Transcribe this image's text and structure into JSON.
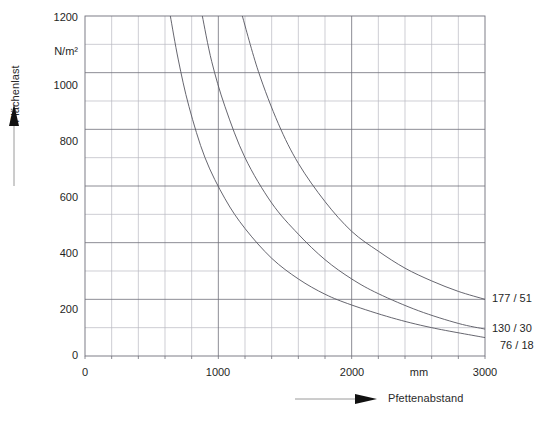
{
  "chart_data": {
    "type": "line",
    "title": "",
    "subtitle": "",
    "xlabel": "Pfettenabstand",
    "ylabel": "Flächenlast",
    "x_unit": "mm",
    "y_unit": "N/m²",
    "xlim": [
      0,
      3000
    ],
    "ylim": [
      0,
      1200
    ],
    "x_ticks": [
      0,
      1000,
      2000,
      3000
    ],
    "x_tick_labels": [
      "0",
      "1000",
      "2000",
      "3000"
    ],
    "y_ticks": [
      0,
      200,
      400,
      600,
      800,
      1000,
      1200
    ],
    "y_tick_labels": [
      "0",
      "200",
      "400",
      "600",
      "800",
      "1000",
      "1200"
    ],
    "x_minor_step": 200,
    "y_minor_step": 100,
    "grid": true,
    "grid_color": "#8c8c99",
    "legend_position": "right-inline",
    "series": [
      {
        "name": "177 / 51",
        "label": "177 / 51",
        "color": "#55555f",
        "x": [
          1180,
          1300,
          1450,
          1600,
          1800,
          2000,
          2200,
          2400,
          2600,
          2800,
          3000
        ],
        "y": [
          1200,
          1005,
          820,
          680,
          545,
          440,
          370,
          310,
          265,
          228,
          200
        ]
      },
      {
        "name": "130 / 30",
        "label": "130 / 30",
        "color": "#55555f",
        "x": [
          880,
          950,
          1050,
          1200,
          1400,
          1600,
          1800,
          2000,
          2200,
          2500,
          2800,
          3000
        ],
        "y": [
          1200,
          1040,
          880,
          700,
          540,
          430,
          340,
          272,
          220,
          160,
          115,
          95
        ]
      },
      {
        "name": "76 / 18",
        "label": "76 / 18",
        "color": "#55555f",
        "x": [
          640,
          700,
          780,
          900,
          1050,
          1200,
          1400,
          1600,
          1800,
          2000,
          2300,
          2600,
          3000
        ],
        "y": [
          1200,
          1045,
          880,
          700,
          555,
          450,
          345,
          272,
          218,
          180,
          135,
          100,
          65
        ]
      }
    ]
  },
  "axis": {
    "y_title": "Flächenlast",
    "y_unit_label": "N/m²",
    "x_title": "Pfettenabstand",
    "x_unit_label": "mm"
  },
  "labels": {
    "curve_top": "177 / 51",
    "curve_middle": "130 / 30",
    "curve_bottom": "76 / 18"
  }
}
